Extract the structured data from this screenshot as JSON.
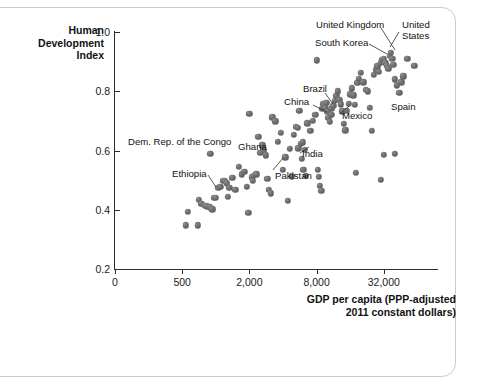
{
  "chart_data": {
    "type": "scatter",
    "title": "",
    "xlabel": "GDP per capita (PPP-adjusted 2011 constant dollars)",
    "xlabel_line1": "GDP per capita (PPP-adjusted",
    "xlabel_line2": "2011 constant dollars)",
    "ylabel": "Human Development Index",
    "ylabel_line1": "Human",
    "ylabel_line2": "Development",
    "ylabel_line3": "Index",
    "x_scale": "log4",
    "x_ticks": [
      "0",
      "500",
      "2,000",
      "8,000",
      "32,000"
    ],
    "x_tick_values": [
      0,
      500,
      2000,
      8000,
      32000
    ],
    "y_ticks": [
      "1.0",
      "0.8",
      "0.6",
      "0.4",
      "0.2"
    ],
    "y_tick_values": [
      1.0,
      0.8,
      0.6,
      0.4,
      0.2
    ],
    "ylim": [
      0.2,
      1.0
    ],
    "grid": false,
    "legend": "none",
    "marker_color": "#6b6b6b",
    "axis_color": "#2b2b2b",
    "annotations": [
      {
        "label": "United Kingdom"
      },
      {
        "label": "United States"
      },
      {
        "label": "South Korea"
      },
      {
        "label": "Brazil"
      },
      {
        "label": "China"
      },
      {
        "label": "Mexico"
      },
      {
        "label": "Spain"
      },
      {
        "label": "Dem. Rep. of the Congo"
      },
      {
        "label": "Ghana"
      },
      {
        "label": "India"
      },
      {
        "label": "Ethiopia"
      },
      {
        "label": "Pakistan"
      }
    ],
    "points": [
      [
        540,
        0.348
      ],
      [
        690,
        0.348
      ],
      [
        560,
        0.394
      ],
      [
        700,
        0.433
      ],
      [
        740,
        0.42
      ],
      [
        800,
        0.414
      ],
      [
        830,
        0.412
      ],
      [
        880,
        0.408
      ],
      [
        930,
        0.401
      ],
      [
        960,
        0.441
      ],
      [
        1000,
        0.44
      ],
      [
        1050,
        0.474
      ],
      [
        1100,
        0.478
      ],
      [
        1150,
        0.497
      ],
      [
        1200,
        0.498
      ],
      [
        1250,
        0.489
      ],
      [
        1320,
        0.475
      ],
      [
        1400,
        0.508
      ],
      [
        1500,
        0.468
      ],
      [
        1600,
        0.545
      ],
      [
        1700,
        0.52
      ],
      [
        1800,
        0.529
      ],
      [
        1900,
        0.478
      ],
      [
        1950,
        0.39
      ],
      [
        2000,
        0.724
      ],
      [
        2100,
        0.51
      ],
      [
        2150,
        0.497
      ],
      [
        2200,
        0.515
      ],
      [
        2300,
        0.52
      ],
      [
        2400,
        0.646
      ],
      [
        2500,
        0.592
      ],
      [
        2600,
        0.617
      ],
      [
        2700,
        0.6
      ],
      [
        2800,
        0.584
      ],
      [
        2900,
        0.505
      ],
      [
        3000,
        0.468
      ],
      [
        3100,
        0.456
      ],
      [
        3200,
        0.712
      ],
      [
        3400,
        0.698
      ],
      [
        3600,
        0.629
      ],
      [
        3800,
        0.66
      ],
      [
        4000,
        0.535
      ],
      [
        4200,
        0.577
      ],
      [
        4400,
        0.431
      ],
      [
        4600,
        0.606
      ],
      [
        4800,
        0.513
      ],
      [
        5000,
        0.653
      ],
      [
        5200,
        0.681
      ],
      [
        5400,
        0.676
      ],
      [
        5600,
        0.735
      ],
      [
        5800,
        0.623
      ],
      [
        6000,
        0.628
      ],
      [
        6300,
        0.602
      ],
      [
        6600,
        0.692
      ],
      [
        7000,
        0.667
      ],
      [
        7400,
        0.7
      ],
      [
        7800,
        0.72
      ],
      [
        8000,
        0.905
      ],
      [
        8200,
        0.534
      ],
      [
        8400,
        0.512
      ],
      [
        8600,
        0.48
      ],
      [
        8800,
        0.463
      ],
      [
        9000,
        0.74
      ],
      [
        9200,
        0.757
      ],
      [
        9400,
        0.752
      ],
      [
        9600,
        0.744
      ],
      [
        9800,
        0.762
      ],
      [
        10000,
        0.73
      ],
      [
        10200,
        0.71
      ],
      [
        10500,
        0.697
      ],
      [
        10800,
        0.72
      ],
      [
        11000,
        0.742
      ],
      [
        11300,
        0.75
      ],
      [
        11600,
        0.768
      ],
      [
        12000,
        0.785
      ],
      [
        12400,
        0.8
      ],
      [
        12800,
        0.772
      ],
      [
        13200,
        0.756
      ],
      [
        13600,
        0.732
      ],
      [
        14000,
        0.69
      ],
      [
        14500,
        0.668
      ],
      [
        15000,
        0.733
      ],
      [
        15500,
        0.758
      ],
      [
        16000,
        0.79
      ],
      [
        16500,
        0.81
      ],
      [
        17000,
        0.786
      ],
      [
        17500,
        0.754
      ],
      [
        18000,
        0.524
      ],
      [
        18500,
        0.828
      ],
      [
        19000,
        0.843
      ],
      [
        20000,
        0.862
      ],
      [
        21000,
        0.83
      ],
      [
        22000,
        0.805
      ],
      [
        23000,
        0.8
      ],
      [
        24000,
        0.745
      ],
      [
        25000,
        0.667
      ],
      [
        26000,
        0.855
      ],
      [
        27000,
        0.872
      ],
      [
        28000,
        0.884
      ],
      [
        29000,
        0.866
      ],
      [
        30000,
        0.897
      ],
      [
        31000,
        0.906
      ],
      [
        32000,
        0.91
      ],
      [
        33000,
        0.895
      ],
      [
        34000,
        0.885
      ],
      [
        35000,
        0.876
      ],
      [
        36000,
        0.92
      ],
      [
        37000,
        0.93
      ],
      [
        38000,
        0.91
      ],
      [
        39000,
        0.89
      ],
      [
        40000,
        0.84
      ],
      [
        42000,
        0.82
      ],
      [
        44000,
        0.795
      ],
      [
        46000,
        0.83
      ],
      [
        48000,
        0.85
      ],
      [
        52000,
        0.91
      ],
      [
        60000,
        0.886
      ],
      [
        32000,
        0.586
      ],
      [
        40000,
        0.588
      ],
      [
        30000,
        0.502
      ],
      [
        890,
        0.588
      ],
      [
        1280,
        0.443
      ],
      [
        5500,
        0.608
      ],
      [
        5900,
        0.572
      ],
      [
        6100,
        0.535
      ],
      [
        6400,
        0.514
      ]
    ]
  }
}
